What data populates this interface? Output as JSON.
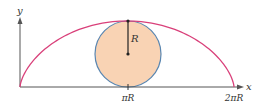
{
  "diagram": {
    "axes": {
      "x_label": "x",
      "y_label": "y",
      "color": "#555555"
    },
    "ticks": [
      {
        "label": "πR",
        "x": 128
      },
      {
        "label": "2πR",
        "x": 234
      }
    ],
    "circle": {
      "cx": 128,
      "cy": 54,
      "r": 33,
      "fill": "#f9d3b4",
      "stroke": "#5a86b0"
    },
    "radius_label": "R",
    "curve": {
      "name": "cycloid",
      "color": "#d9407a",
      "start_x": 20,
      "end_x": 234,
      "baseline_y": 87,
      "peak_y": 21
    }
  }
}
